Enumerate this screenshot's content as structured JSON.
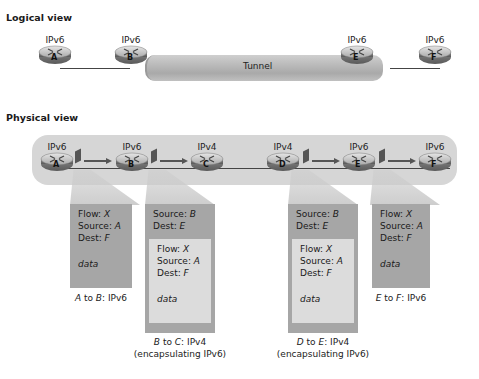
{
  "logical_view": {
    "title": "Logical view",
    "tunnel_label": "Tunnel",
    "routers": [
      {
        "id": "A",
        "protocol": "IPv6"
      },
      {
        "id": "B",
        "protocol": "IPv6"
      },
      {
        "id": "E",
        "protocol": "IPv6"
      },
      {
        "id": "F",
        "protocol": "IPv6"
      }
    ]
  },
  "physical_view": {
    "title": "Physical view",
    "routers": [
      {
        "id": "A",
        "protocol": "IPv6"
      },
      {
        "id": "B",
        "protocol": "IPv6"
      },
      {
        "id": "C",
        "protocol": "IPv4"
      },
      {
        "id": "D",
        "protocol": "IPv4"
      },
      {
        "id": "E",
        "protocol": "IPv6"
      },
      {
        "id": "F",
        "protocol": "IPv6"
      }
    ],
    "packets": [
      {
        "caption_from": "A",
        "caption_to": "B",
        "caption_proto": ": IPv6",
        "caption_note": "",
        "outer": null,
        "inner": {
          "flow": "X",
          "source": "A",
          "dest": "F",
          "data": "data"
        }
      },
      {
        "caption_from": "B",
        "caption_to": "C",
        "caption_proto": ": IPv4",
        "caption_note": "(encapsulating IPv6)",
        "outer": {
          "source": "B",
          "dest": "E"
        },
        "inner": {
          "flow": "X",
          "source": "A",
          "dest": "F",
          "data": "data"
        }
      },
      {
        "caption_from": "D",
        "caption_to": "E",
        "caption_proto": ": IPv4",
        "caption_note": "(encapsulating IPv6)",
        "outer": {
          "source": "B",
          "dest": "E"
        },
        "inner": {
          "flow": "X",
          "source": "A",
          "dest": "F",
          "data": "data"
        }
      },
      {
        "caption_from": "E",
        "caption_to": "F",
        "caption_proto": ": IPv6",
        "caption_note": "",
        "outer": null,
        "inner": {
          "flow": "X",
          "source": "A",
          "dest": "F",
          "data": "data"
        }
      }
    ]
  },
  "labels": {
    "flow": "Flow: ",
    "source": "Source: ",
    "dest": "Dest: ",
    "to": " to "
  },
  "colors": {
    "packet_ipv6": "#a6a6a6",
    "packet_ipv4_outer": "#a6a6a6",
    "packet_inner": "#dcdcdc",
    "physical_bg": "#d6d6d6"
  }
}
